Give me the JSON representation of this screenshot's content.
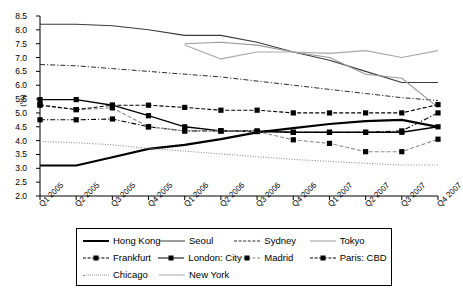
{
  "chart_data": {
    "type": "line",
    "title": "",
    "xlabel": "",
    "ylabel": "(%)",
    "ylim": [
      2.0,
      8.5
    ],
    "ytick_step": 0.5,
    "yticks": [
      "8.5",
      "8.0",
      "7.5",
      "7.0",
      "6.5",
      "6.0",
      "5.5",
      "5.0",
      "4.5",
      "4.0",
      "3.5",
      "3.0",
      "2.5",
      "2.0"
    ],
    "grid": false,
    "legend_position": "bottom",
    "categories": [
      "Q1 2005",
      "Q2 2005",
      "Q3 2005",
      "Q4 2005",
      "Q1 2006",
      "Q2 2006",
      "Q3 2006",
      "Q4 2006",
      "Q1 2007",
      "Q2 2007",
      "Q3 2007",
      "Q4 2007"
    ],
    "series": [
      {
        "name": "Hong Kong",
        "style": "solid-thick",
        "color": "#000000",
        "width": 2.2,
        "marker": "none",
        "values": [
          3.1,
          3.1,
          3.4,
          3.7,
          3.85,
          4.05,
          4.3,
          4.45,
          4.6,
          4.7,
          4.75,
          4.5
        ]
      },
      {
        "name": "Seoul",
        "style": "solid",
        "color": "#3a3a3a",
        "width": 1.1,
        "marker": "none",
        "values": [
          8.2,
          8.2,
          8.15,
          8.0,
          7.8,
          7.8,
          7.55,
          7.2,
          6.9,
          6.5,
          6.1,
          6.1
        ]
      },
      {
        "name": "Sydney",
        "style": "dashdot",
        "color": "#2b2b2b",
        "width": 1.0,
        "marker": "none",
        "values": [
          6.75,
          6.7,
          6.6,
          6.5,
          6.4,
          6.3,
          6.15,
          6.0,
          5.85,
          5.7,
          5.55,
          5.45
        ]
      },
      {
        "name": "Tokyo",
        "style": "solid",
        "color": "#9a9a9a",
        "width": 1.1,
        "marker": "none",
        "values": [
          null,
          null,
          null,
          null,
          7.5,
          7.55,
          7.45,
          7.2,
          7.0,
          6.4,
          6.25,
          5.2
        ]
      },
      {
        "name": "Frankfurt",
        "style": "dashdot",
        "color": "#000000",
        "width": 1.1,
        "marker": "square",
        "values": [
          4.75,
          4.75,
          4.78,
          4.5,
          4.35,
          4.35,
          4.35,
          4.3,
          4.3,
          4.3,
          4.35,
          5.0
        ]
      },
      {
        "name": "London: City",
        "style": "solid",
        "color": "#000000",
        "width": 1.4,
        "marker": "square",
        "values": [
          5.48,
          5.48,
          5.28,
          4.9,
          4.5,
          4.35,
          4.33,
          4.3,
          4.3,
          4.3,
          4.3,
          4.5
        ]
      },
      {
        "name": "Madrid",
        "style": "dashed",
        "color": "#8d8d8d",
        "width": 1.1,
        "marker": "square",
        "values": [
          5.3,
          5.12,
          5.18,
          4.5,
          4.35,
          4.35,
          4.33,
          4.03,
          3.9,
          3.6,
          3.6,
          4.05
        ]
      },
      {
        "name": "Paris: CBD",
        "style": "dashed",
        "color": "#000000",
        "width": 1.1,
        "marker": "square",
        "values": [
          5.28,
          5.12,
          5.28,
          5.28,
          5.2,
          5.1,
          5.1,
          5.0,
          5.0,
          5.0,
          5.0,
          5.3
        ]
      },
      {
        "name": "Chicago",
        "style": "dotted",
        "color": "#8d8d8d",
        "width": 1.1,
        "marker": "none",
        "values": [
          3.97,
          3.92,
          3.85,
          3.72,
          3.62,
          3.52,
          3.42,
          3.32,
          3.25,
          3.18,
          3.12,
          3.12
        ]
      },
      {
        "name": "New York",
        "style": "solid",
        "color": "#a8a8a8",
        "width": 1.1,
        "marker": "none",
        "values": [
          null,
          null,
          null,
          null,
          7.45,
          6.95,
          7.2,
          7.2,
          7.15,
          7.25,
          7.0,
          7.25
        ]
      }
    ],
    "legend_rows": [
      [
        {
          "label": "Hong Kong",
          "style": "solid-thick",
          "color": "#000000",
          "marker": "none"
        },
        {
          "label": "Seoul",
          "style": "solid",
          "color": "#3a3a3a",
          "marker": "none"
        },
        {
          "label": "Sydney",
          "style": "dashdot",
          "color": "#2b2b2b",
          "marker": "none"
        },
        {
          "label": "Tokyo",
          "style": "solid",
          "color": "#9a9a9a",
          "marker": "none"
        }
      ],
      [
        {
          "label": "Frankfurt",
          "style": "dashdot",
          "color": "#000000",
          "marker": "square"
        },
        {
          "label": "London: City",
          "style": "solid",
          "color": "#000000",
          "marker": "square"
        },
        {
          "label": "Madrid",
          "style": "dashed",
          "color": "#8d8d8d",
          "marker": "square"
        },
        {
          "label": "Paris: CBD",
          "style": "dashed",
          "color": "#000000",
          "marker": "square"
        }
      ],
      [
        {
          "label": "Chicago",
          "style": "dotted",
          "color": "#8d8d8d",
          "marker": "none"
        },
        {
          "label": "New York",
          "style": "solid",
          "color": "#a8a8a8",
          "marker": "none"
        }
      ]
    ]
  }
}
